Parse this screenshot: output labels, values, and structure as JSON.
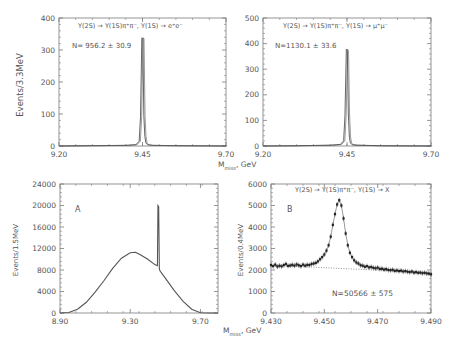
{
  "figure": {
    "shared_xlabel_top": "M_miss, GeV",
    "shared_xlabel_bottom": "M_miss, GeV",
    "colors": {
      "frame": "#7a7a7a",
      "curve": "#555555",
      "points": "#222222",
      "text": "#555555",
      "background": "#ffffff"
    }
  },
  "chart_data": [
    {
      "id": "top-left",
      "type": "line",
      "style": "histogram",
      "title": "Υ(2S) → Υ(1S)π⁺π⁻, Υ(1S) → e⁺e⁻",
      "annotation": "N= 956.2 ± 30.9",
      "xlabel": "M_miss, GeV",
      "ylabel": "Events/3.3MeV",
      "xlim": [
        9.2,
        9.7
      ],
      "ylim": [
        0,
        400
      ],
      "xticks": [
        "9.20",
        "9.45",
        "9.70"
      ],
      "yticks": [
        "0",
        "100",
        "200",
        "300",
        "400"
      ],
      "grid": false,
      "frame": {
        "x": 59,
        "y": 18,
        "w": 167,
        "h": 128
      },
      "x": [
        9.2,
        9.3,
        9.4,
        9.43,
        9.44,
        9.444,
        9.448,
        9.451,
        9.454,
        9.457,
        9.46,
        9.465,
        9.48,
        9.55,
        9.7
      ],
      "values": [
        0,
        1,
        2,
        4,
        15,
        92,
        338,
        336,
        95,
        30,
        10,
        4,
        2,
        1,
        0
      ]
    },
    {
      "id": "top-right",
      "type": "line",
      "style": "histogram",
      "title": "Υ(2S) → Υ(1S)π⁺π⁻, Υ(1S) → μ⁺μ⁻",
      "annotation": "N=1130.1 ± 33.6",
      "xlabel": "M_miss, GeV",
      "ylabel": "",
      "xlim": [
        9.2,
        9.7
      ],
      "ylim": [
        0,
        500
      ],
      "xticks": [
        "9.20",
        "9.45",
        "9.70"
      ],
      "yticks": [
        "0",
        "100",
        "200",
        "300",
        "400",
        "500"
      ],
      "grid": false,
      "frame": {
        "x": 263,
        "y": 18,
        "w": 168,
        "h": 128
      },
      "x": [
        9.2,
        9.3,
        9.4,
        9.43,
        9.44,
        9.444,
        9.448,
        9.451,
        9.454,
        9.457,
        9.46,
        9.465,
        9.48,
        9.55,
        9.7
      ],
      "values": [
        0,
        1,
        3,
        6,
        20,
        120,
        378,
        372,
        125,
        35,
        12,
        5,
        3,
        1,
        0
      ]
    },
    {
      "id": "bottom-left",
      "type": "line",
      "title": "",
      "annotation": "A",
      "xlabel": "M_miss, GeV",
      "ylabel": "Events/1.5MeV",
      "xlim": [
        8.9,
        9.8
      ],
      "ylim": [
        0,
        24000
      ],
      "xticks": [
        "8.90",
        "9.30",
        "9.70"
      ],
      "xtick_values": [
        8.9,
        9.3,
        9.7
      ],
      "yticks": [
        "0",
        "4000",
        "8000",
        "12000",
        "16000",
        "20000",
        "24000"
      ],
      "grid": false,
      "frame": {
        "x": 60,
        "y": 184,
        "w": 158,
        "h": 129
      },
      "x": [
        8.9,
        8.95,
        9.0,
        9.05,
        9.1,
        9.15,
        9.2,
        9.25,
        9.3,
        9.33,
        9.36,
        9.4,
        9.44,
        9.455,
        9.458,
        9.462,
        9.466,
        9.47,
        9.5,
        9.55,
        9.6,
        9.65,
        9.7,
        9.75,
        9.8
      ],
      "values": [
        0,
        100,
        700,
        2000,
        3900,
        6000,
        8300,
        10200,
        11200,
        11300,
        10800,
        10000,
        9000,
        8800,
        20000,
        19800,
        8200,
        7800,
        6500,
        4200,
        2200,
        700,
        50,
        0,
        0
      ]
    },
    {
      "id": "bottom-right",
      "type": "scatter",
      "title": "Υ(2S) → Υ(1S)π⁺π⁻, Υ(1S) → X",
      "annotation": "B",
      "annotation2": "N=50566 ± 575",
      "xlabel": "M_miss, GeV",
      "ylabel": "Events/0.4MeV",
      "xlim": [
        9.43,
        9.49
      ],
      "ylim": [
        0,
        6000
      ],
      "xticks": [
        "9.430",
        "9.450",
        "9.470",
        "9.490"
      ],
      "xtick_values": [
        9.43,
        9.45,
        9.47,
        9.49
      ],
      "yticks": [
        "0",
        "1000",
        "2000",
        "3000",
        "4000",
        "5000",
        "6000"
      ],
      "grid": false,
      "frame": {
        "x": 271,
        "y": 184,
        "w": 160,
        "h": 129
      },
      "background_fit": {
        "x": [
          9.43,
          9.49
        ],
        "values": [
          2220,
          1880
        ],
        "style": "dotted"
      },
      "x": [
        9.43,
        9.4308,
        9.4316,
        9.4324,
        9.4332,
        9.434,
        9.4348,
        9.4356,
        9.4364,
        9.4372,
        9.438,
        9.4388,
        9.4396,
        9.4404,
        9.4412,
        9.442,
        9.4428,
        9.4436,
        9.4444,
        9.4452,
        9.446,
        9.4468,
        9.4476,
        9.4484,
        9.4492,
        9.45,
        9.4508,
        9.4516,
        9.4524,
        9.4532,
        9.454,
        9.4548,
        9.4556,
        9.4564,
        9.4572,
        9.458,
        9.4588,
        9.4596,
        9.4604,
        9.4612,
        9.462,
        9.4628,
        9.4636,
        9.4644,
        9.4652,
        9.466,
        9.4668,
        9.4676,
        9.4684,
        9.4692,
        9.47,
        9.4708,
        9.4716,
        9.4724,
        9.4732,
        9.474,
        9.4748,
        9.4756,
        9.4764,
        9.4772,
        9.478,
        9.4788,
        9.4796,
        9.4804,
        9.4812,
        9.482,
        9.4828,
        9.4836,
        9.4844,
        9.4852,
        9.486,
        9.4868,
        9.4876,
        9.4884,
        9.4892,
        9.49
      ],
      "values": [
        2230,
        2180,
        2250,
        2160,
        2200,
        2170,
        2230,
        2280,
        2190,
        2210,
        2240,
        2200,
        2260,
        2220,
        2180,
        2250,
        2200,
        2240,
        2230,
        2280,
        2300,
        2330,
        2400,
        2500,
        2600,
        2720,
        2900,
        3150,
        3550,
        4100,
        4600,
        5050,
        5250,
        5000,
        4400,
        3700,
        3150,
        2800,
        2600,
        2450,
        2350,
        2300,
        2220,
        2200,
        2150,
        2180,
        2120,
        2140,
        2100,
        2080,
        2110,
        2050,
        2060,
        2020,
        2040,
        2000,
        1990,
        2010,
        1960,
        1980,
        1950,
        1970,
        1930,
        1950,
        1920,
        1900,
        1930,
        1880,
        1900,
        1870,
        1880,
        1850,
        1870,
        1840,
        1830,
        1800
      ]
    }
  ]
}
